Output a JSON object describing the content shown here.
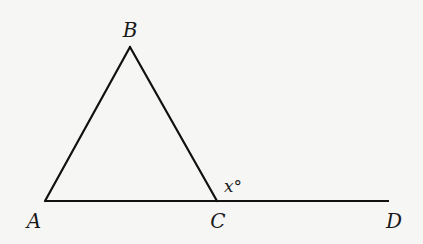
{
  "figure": {
    "type": "geometry-diagram",
    "stroke_color": "#111111",
    "background_color": "#f6f6f4",
    "points": {
      "A": {
        "label": "A",
        "x": 45,
        "y": 201
      },
      "B": {
        "label": "B",
        "x": 130,
        "y": 47
      },
      "C": {
        "label": "C",
        "x": 217,
        "y": 201
      },
      "D": {
        "label": "D",
        "x": 389,
        "y": 201
      }
    },
    "segments": [
      {
        "from": "A",
        "to": "B"
      },
      {
        "from": "B",
        "to": "C"
      },
      {
        "from": "A",
        "to": "D"
      }
    ],
    "angle_marks": [
      {
        "vertex": "C",
        "between": [
          "B",
          "D"
        ],
        "label": "x°"
      }
    ]
  },
  "labels": {
    "A": "A",
    "B": "B",
    "C": "C",
    "D": "D",
    "angle_x": "x°"
  }
}
